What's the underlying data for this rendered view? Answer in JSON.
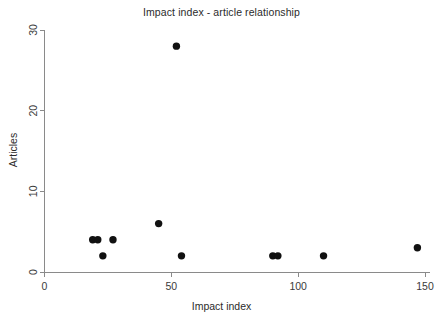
{
  "chart_data": {
    "type": "scatter",
    "title": "Impact index - article relationship",
    "xlabel": "Impact index",
    "ylabel": "Articles",
    "xlim": [
      0,
      152
    ],
    "ylim": [
      0,
      30
    ],
    "xticks": [
      0,
      50,
      100,
      150
    ],
    "xtick_labels": [
      "0",
      "50",
      "100",
      "150"
    ],
    "yticks": [
      0,
      10,
      20,
      30
    ],
    "ytick_labels": [
      "0",
      "10",
      "20",
      "30"
    ],
    "grid": false,
    "legend": null,
    "marker": {
      "shape": "circle",
      "color": "#111111",
      "size": 5
    },
    "points": [
      {
        "x": 19,
        "y": 4
      },
      {
        "x": 21,
        "y": 4
      },
      {
        "x": 23,
        "y": 2
      },
      {
        "x": 27,
        "y": 4
      },
      {
        "x": 45,
        "y": 6
      },
      {
        "x": 52,
        "y": 28
      },
      {
        "x": 54,
        "y": 2
      },
      {
        "x": 90,
        "y": 2
      },
      {
        "x": 92,
        "y": 2
      },
      {
        "x": 110,
        "y": 2
      },
      {
        "x": 147,
        "y": 3
      }
    ]
  },
  "axes": {
    "x_title": "Impact index",
    "y_title": "Articles"
  }
}
